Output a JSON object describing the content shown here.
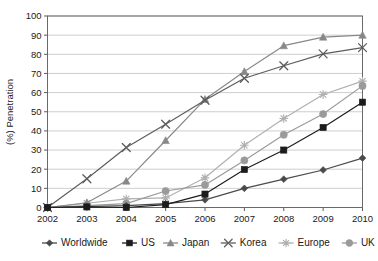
{
  "chart_data": {
    "type": "line",
    "title": "",
    "xlabel": "",
    "ylabel": "(%) Penetration",
    "x": [
      2002,
      2003,
      2004,
      2005,
      2006,
      2007,
      2008,
      2009,
      2010
    ],
    "categories": [
      "2002",
      "2003",
      "2004",
      "2005",
      "2006",
      "2007",
      "2008",
      "2009",
      "2010"
    ],
    "ylim": [
      0,
      100
    ],
    "yticks": [
      0,
      10,
      20,
      30,
      40,
      50,
      60,
      70,
      80,
      90,
      100
    ],
    "ytick_labels": [
      "0",
      "10",
      "20",
      "30",
      "40",
      "50",
      "60",
      "70",
      "80",
      "90",
      "100"
    ],
    "grid": "horizontal",
    "legend_position": "bottom",
    "series": [
      {
        "name": "Worldwide",
        "marker": "diamond",
        "color": "#4a4a4a",
        "values": [
          0,
          0.5,
          1,
          2,
          4,
          10,
          14.8,
          19.6,
          25.8
        ]
      },
      {
        "name": "US",
        "marker": "square",
        "color": "#1c1c1c",
        "values": [
          0,
          0.3,
          0,
          1.5,
          7,
          19.8,
          30,
          41.8,
          55
        ]
      },
      {
        "name": "Japan",
        "marker": "triangle",
        "color": "#888888",
        "values": [
          0,
          2.5,
          13.8,
          35,
          56.5,
          71,
          84.5,
          89,
          90
        ]
      },
      {
        "name": "Korea",
        "marker": "x",
        "color": "#5c5c5c",
        "values": [
          0,
          15,
          31.3,
          43.5,
          56,
          67.5,
          74,
          80.2,
          83.5
        ]
      },
      {
        "name": "Europe",
        "marker": "asterisk",
        "color": "#b0b0b0",
        "values": [
          0,
          2.2,
          4.5,
          5,
          15.5,
          32.5,
          46.5,
          59,
          66
        ]
      },
      {
        "name": "UK",
        "marker": "circle",
        "color": "#9a9a9a",
        "values": [
          0,
          1,
          2,
          8.6,
          11.8,
          24.6,
          38,
          48.8,
          63.5
        ]
      }
    ]
  },
  "legend": {
    "items": [
      {
        "label": "Worldwide"
      },
      {
        "label": "US"
      },
      {
        "label": "Japan"
      },
      {
        "label": "Korea"
      },
      {
        "label": "Europe"
      },
      {
        "label": "UK"
      }
    ]
  }
}
